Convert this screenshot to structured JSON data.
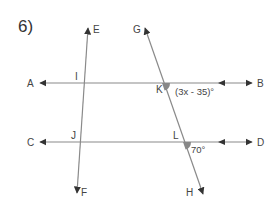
{
  "problem": {
    "number": "6)"
  },
  "colors": {
    "line": "#8a8a8a",
    "arrow": "#333333",
    "angle_marker": "#888888",
    "text": "#444444"
  },
  "points": {
    "A": "A",
    "B": "B",
    "C": "C",
    "D": "D",
    "E": "E",
    "F": "F",
    "G": "G",
    "H": "H",
    "I": "I",
    "J": "J",
    "K": "K",
    "L": "L"
  },
  "angles": {
    "K": "(3x - 35)°",
    "L": "70°"
  },
  "lines": [
    {
      "name": "AB",
      "from": "A",
      "to": "B"
    },
    {
      "name": "CD",
      "from": "C",
      "to": "D"
    },
    {
      "name": "EF",
      "from": "E",
      "to": "F"
    },
    {
      "name": "GH",
      "from": "G",
      "to": "H"
    }
  ]
}
